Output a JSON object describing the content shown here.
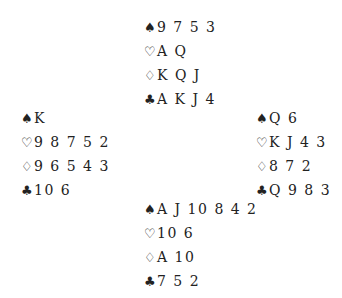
{
  "suit_symbols": {
    "spades": "♠",
    "hearts": "♡",
    "diamonds": "♢",
    "clubs": "♣"
  },
  "deal": {
    "north": {
      "spades": "9 7 5 3",
      "hearts": "A Q",
      "diamonds": "K Q J",
      "clubs": "A K J 4"
    },
    "west": {
      "spades": "K",
      "hearts": "9 8 7 5 2",
      "diamonds": "9 6 5 4 3",
      "clubs": "10 6"
    },
    "east": {
      "spades": "Q 6",
      "hearts": "K J 4 3",
      "diamonds": "8 7 2",
      "clubs": "Q 9 8 3"
    },
    "south": {
      "spades": "A J 10 8 4 2",
      "hearts": "10 6",
      "diamonds": "A 10",
      "clubs": "7 5 2"
    }
  }
}
